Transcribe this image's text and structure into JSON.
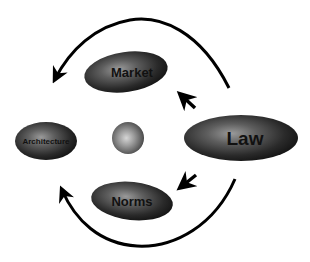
{
  "diagram": {
    "type": "influence-diagram",
    "colors": {
      "background": "#ffffff",
      "node_dark": "#1c1c1c",
      "node_highlight": "#8a8a8a",
      "arrow": "#000000",
      "text": "#111111"
    },
    "nodes": [
      {
        "id": "market",
        "label": "Market",
        "cx": 126,
        "cy": 72,
        "rx": 42,
        "ry": 20,
        "font_size": 13
      },
      {
        "id": "architecture",
        "label": "Architecture",
        "cx": 46,
        "cy": 141,
        "rx": 31,
        "ry": 19,
        "font_size": 8
      },
      {
        "id": "law",
        "label": "Law",
        "cx": 241,
        "cy": 138,
        "rx": 57,
        "ry": 23,
        "font_size": 19
      },
      {
        "id": "norms",
        "label": "Norms",
        "cx": 132,
        "cy": 201,
        "rx": 41,
        "ry": 19,
        "font_size": 13
      },
      {
        "id": "dot",
        "label": "",
        "cx": 128,
        "cy": 138,
        "r": 16
      }
    ],
    "edges": [
      {
        "id": "law-to-architecture-top",
        "from": "law",
        "to": "architecture",
        "kind": "curved-arc-over"
      },
      {
        "id": "law-to-architecture-bottom",
        "from": "law",
        "to": "architecture",
        "kind": "curved-arc-under"
      },
      {
        "id": "law-to-market",
        "from": "law",
        "to": "market",
        "kind": "short-arrow"
      },
      {
        "id": "law-to-norms",
        "from": "law",
        "to": "norms",
        "kind": "short-arrow"
      }
    ]
  }
}
